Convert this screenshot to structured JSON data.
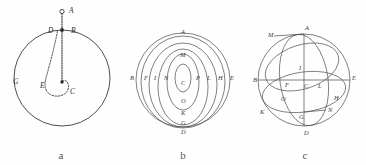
{
  "plate": {
    "background_color": "#fefefe",
    "ink_color": "#3a3a3c",
    "figure_count": 3
  },
  "figures": [
    {
      "id": "a",
      "caption": "a",
      "description": "Large circle with center C, radius line to B at top, point A outside above B, dashed curve from D through E around C",
      "labels": [
        {
          "text": "A",
          "x": 69,
          "y": 12
        },
        {
          "text": "B",
          "x": 72,
          "y": 32
        },
        {
          "text": "D",
          "x": 50,
          "y": 32
        },
        {
          "text": "C",
          "x": 72,
          "y": 94
        },
        {
          "text": "E",
          "x": 44,
          "y": 88
        },
        {
          "text": "G",
          "x": 16,
          "y": 82
        }
      ],
      "circle": {
        "cx": 62,
        "cy": 78,
        "r": 48
      },
      "center_point": {
        "x": 62,
        "y": 82
      },
      "top_point": {
        "x": 62,
        "y": 30
      },
      "outer_point": {
        "x": 62,
        "y": 12
      }
    },
    {
      "id": "b",
      "caption": "b",
      "description": "Family of nested concentric ovals inside an outer circle; lettered along the vertical and horizontal axes",
      "labels_vertical": [
        {
          "text": "A",
          "x": 61,
          "y": 32
        },
        {
          "text": "M",
          "x": 61,
          "y": 55
        },
        {
          "text": "C",
          "x": 61,
          "y": 82
        },
        {
          "text": "O",
          "x": 61,
          "y": 100
        },
        {
          "text": "K",
          "x": 61,
          "y": 113
        },
        {
          "text": "G",
          "x": 61,
          "y": 124
        },
        {
          "text": "D",
          "x": 61,
          "y": 133
        }
      ],
      "labels_horizontal": [
        {
          "text": "B",
          "x": 11,
          "y": 78
        },
        {
          "text": "F",
          "x": 25,
          "y": 78
        },
        {
          "text": "I",
          "x": 35,
          "y": 78
        },
        {
          "text": "N",
          "x": 45,
          "y": 78
        },
        {
          "text": "P",
          "x": 77,
          "y": 78
        },
        {
          "text": "L",
          "x": 87,
          "y": 78
        },
        {
          "text": "H",
          "x": 98,
          "y": 78
        },
        {
          "text": "E",
          "x": 110,
          "y": 78
        }
      ],
      "oval_count": 5,
      "outer_circle": {
        "cx": 61,
        "cy": 80,
        "r": 47
      }
    },
    {
      "id": "c",
      "caption": "c",
      "description": "Circle with vertical diameter A-D and horizontal diameter B-E meeting at center C, crossed by three tilted great-circle ellipses",
      "labels": [
        {
          "text": "M",
          "x": 27,
          "y": 35
        },
        {
          "text": "A",
          "x": 64,
          "y": 28
        },
        {
          "text": "I",
          "x": 57,
          "y": 68
        },
        {
          "text": "B",
          "x": 12,
          "y": 80
        },
        {
          "text": "F",
          "x": 43,
          "y": 85
        },
        {
          "text": "C",
          "x": 62,
          "y": 85
        },
        {
          "text": "L",
          "x": 76,
          "y": 85
        },
        {
          "text": "E",
          "x": 110,
          "y": 79
        },
        {
          "text": "O",
          "x": 40,
          "y": 99
        },
        {
          "text": "H",
          "x": 92,
          "y": 98
        },
        {
          "text": "K",
          "x": 19,
          "y": 112
        },
        {
          "text": "N",
          "x": 81,
          "y": 110
        },
        {
          "text": "G",
          "x": 57,
          "y": 116
        },
        {
          "text": "D",
          "x": 62,
          "y": 133
        }
      ],
      "circle": {
        "cx": 60,
        "cy": 80,
        "r": 46
      },
      "ellipse_count": 3
    }
  ]
}
